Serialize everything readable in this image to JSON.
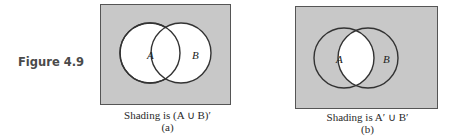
{
  "figure": {
    "label": "Figure 4.9",
    "colors": {
      "shade": "#c8c8c8",
      "unshaded": "#ffffff",
      "stroke": "#333333"
    },
    "panels": [
      {
        "id": "a",
        "set_labels": [
          "A",
          "B"
        ],
        "caption": "Shading is (A ∪ B)′",
        "sublabel": "(a)",
        "shaded_region": "complement of A union B"
      },
      {
        "id": "b",
        "set_labels": [
          "A",
          "B"
        ],
        "caption": "Shading is A′ ∪ B′",
        "sublabel": "(b)",
        "shaded_region": "everything except A intersect B"
      }
    ]
  }
}
